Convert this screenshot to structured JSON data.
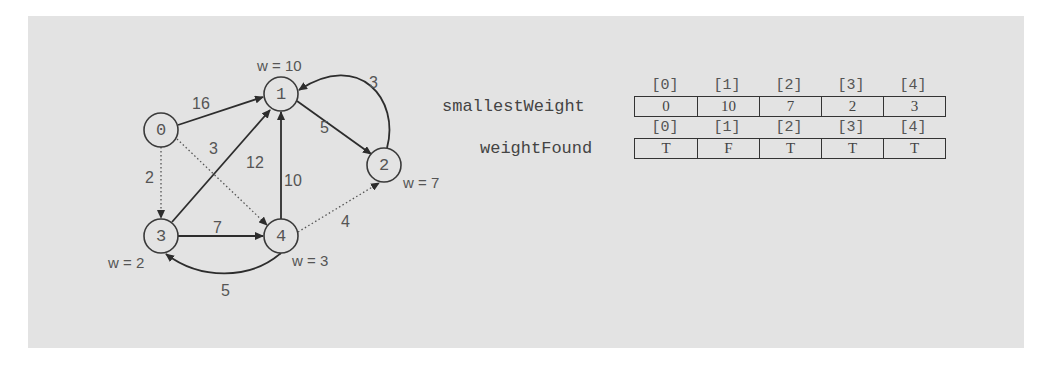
{
  "graph": {
    "nodes": [
      {
        "id": "0",
        "label": "0",
        "weight_label": ""
      },
      {
        "id": "1",
        "label": "1",
        "weight_label": "w = 10"
      },
      {
        "id": "2",
        "label": "2",
        "weight_label": "w = 7"
      },
      {
        "id": "3",
        "label": "3",
        "weight_label": "w = 2"
      },
      {
        "id": "4",
        "label": "4",
        "weight_label": "w = 3"
      }
    ],
    "edges": [
      {
        "from": "0",
        "to": "1",
        "weight": "16",
        "style": "solid"
      },
      {
        "from": "0",
        "to": "3",
        "weight": "2",
        "style": "dotted"
      },
      {
        "from": "0",
        "to": "4",
        "weight": "3",
        "style": "dotted"
      },
      {
        "from": "1",
        "to": "2",
        "weight": "5",
        "style": "solid"
      },
      {
        "from": "2",
        "to": "1",
        "weight": "3",
        "style": "solid"
      },
      {
        "from": "3",
        "to": "1",
        "weight": "12",
        "style": "solid"
      },
      {
        "from": "3",
        "to": "4",
        "weight": "7",
        "style": "solid"
      },
      {
        "from": "4",
        "to": "1",
        "weight": "10",
        "style": "solid"
      },
      {
        "from": "4",
        "to": "2",
        "weight": "4",
        "style": "dotted"
      },
      {
        "from": "4",
        "to": "3",
        "weight": "5",
        "style": "solid"
      }
    ]
  },
  "arrays": {
    "smallestWeight": {
      "name": "smallestWeight",
      "indices": [
        "[0]",
        "[1]",
        "[2]",
        "[3]",
        "[4]"
      ],
      "values": [
        "0",
        "10",
        "7",
        "2",
        "3"
      ]
    },
    "weightFound": {
      "name": "weightFound",
      "indices": [
        "[0]",
        "[1]",
        "[2]",
        "[3]",
        "[4]"
      ],
      "values": [
        "T",
        "F",
        "T",
        "T",
        "T"
      ]
    }
  },
  "colors": {
    "panel_background": "#e3e3e3",
    "stroke": "#2d2d2d",
    "text": "#555555"
  }
}
